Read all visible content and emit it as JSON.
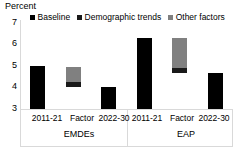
{
  "chart_data": {
    "type": "bar",
    "title": "",
    "ylabel": "Percent",
    "xlabel": "",
    "ylim": [
      3,
      7
    ],
    "yticks": [
      3,
      4,
      5,
      6,
      7
    ],
    "grid": false,
    "legend_position": "top",
    "stacked": true,
    "legend": [
      {
        "name": "Baseline",
        "color": "#000000"
      },
      {
        "name": "Demographic trends",
        "color": "#1a1a1a"
      },
      {
        "name": "Other factors",
        "color": "#808080"
      }
    ],
    "groups": [
      {
        "name": "EMDEs",
        "categories": [
          "2011-21",
          "Factor",
          "2022-30"
        ],
        "bars": [
          {
            "category": "2011-21",
            "base": 3.0,
            "segments": [
              {
                "series": "Baseline",
                "from": 3.0,
                "to": 4.95
              }
            ]
          },
          {
            "category": "Factor",
            "base": 4.0,
            "segments": [
              {
                "series": "Demographic trends",
                "from": 4.0,
                "to": 4.2
              },
              {
                "series": "Other factors",
                "from": 4.2,
                "to": 4.9
              }
            ]
          },
          {
            "category": "2022-30",
            "base": 3.0,
            "segments": [
              {
                "series": "Baseline",
                "from": 3.0,
                "to": 4.0
              }
            ]
          }
        ]
      },
      {
        "name": "EAP",
        "categories": [
          "2011-21",
          "Factor",
          "2022-30"
        ],
        "bars": [
          {
            "category": "2011-21",
            "base": 3.0,
            "segments": [
              {
                "series": "Baseline",
                "from": 3.0,
                "to": 6.2
              }
            ]
          },
          {
            "category": "Factor",
            "base": 4.6,
            "segments": [
              {
                "series": "Demographic trends",
                "from": 4.6,
                "to": 4.85
              },
              {
                "series": "Other factors",
                "from": 4.85,
                "to": 6.2
              }
            ]
          },
          {
            "category": "2022-30",
            "base": 3.0,
            "segments": [
              {
                "series": "Baseline",
                "from": 3.0,
                "to": 4.6
              }
            ]
          }
        ]
      }
    ]
  },
  "axis": {
    "unit_title": "Percent",
    "tick_7": "7",
    "tick_6": "6",
    "tick_5": "5",
    "tick_4": "4",
    "tick_3": "3"
  },
  "legend": {
    "baseline_label": "Baseline",
    "demographic_label": "Demographic trends",
    "other_label": "Other factors"
  },
  "xaxis": {
    "emdes_cat_1": "2011-21",
    "emdes_cat_2": "Factor",
    "emdes_cat_3": "2022-30",
    "eap_cat_1": "2011-21",
    "eap_cat_2": "Factor",
    "eap_cat_3": "2022-30",
    "group_emdes": "EMDEs",
    "group_eap": "EAP"
  }
}
